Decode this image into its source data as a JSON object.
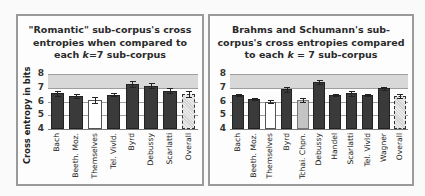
{
  "chart_data": [
    {
      "type": "bar",
      "title": "\"Romantic\" sub-corpus's cross entropies when compared to each k=7 sub-corpus",
      "title_lines": [
        "\"Romantic\" sub-corpus's cross",
        "entropies when compared to",
        "each ",
        "k",
        "=7 sub-corpus"
      ],
      "xlabel": "",
      "ylabel": "Cross entropy in bits",
      "ylim": [
        4,
        8
      ],
      "yticks": [
        4,
        5,
        6,
        7,
        8
      ],
      "grid": true,
      "categories": [
        "Bach",
        "Beeth. Moz.",
        "Themselves",
        "Tel. Vivld.",
        "Byrd",
        "Debussy",
        "Scarlatti",
        "Overall"
      ],
      "values": [
        6.6,
        6.4,
        6.1,
        6.5,
        7.3,
        7.15,
        6.8,
        6.55
      ],
      "errors": [
        0.2,
        0.12,
        0.22,
        0.1,
        0.22,
        0.2,
        0.18,
        0.2
      ],
      "bar_styles": [
        "dark",
        "dark",
        "white",
        "dark",
        "dark",
        "dark",
        "dark",
        "dotted"
      ]
    },
    {
      "type": "bar",
      "title": "Brahms and Schumann's sub-corpus's cross entropies compared to each k = 7 sub-corpus",
      "title_lines": [
        "Brahms and Schumann's sub-",
        "corpus's cross entropies compared",
        "to each ",
        "k",
        " = 7 sub-corpus"
      ],
      "xlabel": "",
      "ylabel": "",
      "ylim": [
        4,
        8
      ],
      "yticks": [
        4,
        5,
        6,
        7,
        8
      ],
      "grid": true,
      "categories": [
        "Bach",
        "Beeth. Moz.",
        "Themselves",
        "Byrd",
        "Tchai. Chpn.",
        "Debussy",
        "Handel",
        "Scarlatti",
        "Tel. Vivld",
        "Wagner",
        "Overall"
      ],
      "values": [
        6.5,
        6.2,
        6.0,
        6.9,
        6.1,
        7.45,
        6.45,
        6.6,
        6.45,
        6.95,
        6.4
      ],
      "errors": [
        0.08,
        0.08,
        0.12,
        0.18,
        0.15,
        0.15,
        0.08,
        0.2,
        0.08,
        0.08,
        0.15
      ],
      "bar_styles": [
        "dark",
        "dark",
        "white",
        "dark",
        "light",
        "dark",
        "dark",
        "dark",
        "dark",
        "dark",
        "dotted"
      ]
    }
  ],
  "colors": {
    "dark": "#3a3a3a",
    "white": "#ffffff",
    "light": "#c4c4c4",
    "dotted": "#e6e6e6",
    "band": "#d8d8d8",
    "grid": "#9e9e9e",
    "border": "#9a9a9a"
  },
  "left": {
    "title_1": "\"Romantic\" sub-corpus's cross",
    "title_2": "entropies when compared to",
    "title_3a": "each ",
    "title_3b": "k",
    "title_3c": "=7 sub-corpus",
    "ylabel": "Cross entropy in bits"
  },
  "right": {
    "title_1": "Brahms and Schumann's sub-",
    "title_2": "corpus's cross entropies compared",
    "title_3a": "to each ",
    "title_3b": "k",
    "title_3c": " = 7 sub-corpus"
  }
}
